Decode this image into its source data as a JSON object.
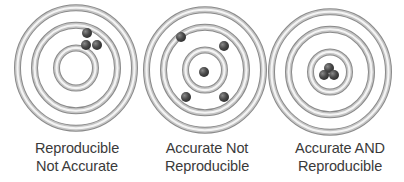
{
  "diagram": {
    "colors": {
      "background": "#ffffff",
      "ring_light": "#f4f4f4",
      "ring_mid": "#c4c4c4",
      "ring_dark": "#8a8a8a",
      "dot": "#4a4a4a",
      "dot_highlight": "#7a7a7a",
      "text": "#3a3a3a"
    },
    "targets": [
      {
        "id": "reproducible-not-accurate",
        "label_line1": "Reproducible",
        "label_line2": "Not Accurate",
        "center": [
          76,
          68
        ],
        "ring_radii": [
          [
            57,
            60
          ],
          [
            40,
            43
          ],
          [
            17,
            22
          ]
        ],
        "dots": [
          [
            87,
            33
          ],
          [
            86,
            45
          ],
          [
            97,
            45
          ]
        ]
      },
      {
        "id": "accurate-not-reproducible",
        "label_line1": "Accurate Not",
        "label_line2": "Reproducible",
        "center": [
          205,
          70
        ],
        "ring_radii": [
          [
            57,
            60
          ],
          [
            40,
            43
          ],
          [
            17,
            22
          ]
        ],
        "dots": [
          [
            181,
            37
          ],
          [
            224,
            46
          ],
          [
            204,
            72
          ],
          [
            186,
            97
          ],
          [
            224,
            97
          ]
        ]
      },
      {
        "id": "accurate-and-reproducible",
        "label_line1": "Accurate AND",
        "label_line2": "Reproducible",
        "center": [
          330,
          72
        ],
        "ring_radii": [
          [
            57,
            60
          ],
          [
            40,
            43
          ],
          [
            17,
            22
          ]
        ],
        "dots": [
          [
            329,
            68
          ],
          [
            324,
            75
          ],
          [
            334,
            75
          ]
        ]
      }
    ]
  }
}
